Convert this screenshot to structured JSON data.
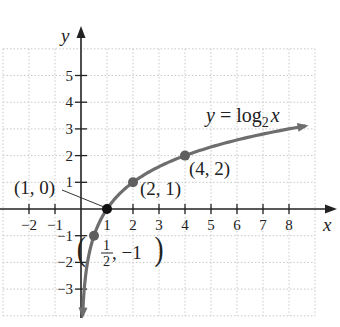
{
  "chart_data": {
    "type": "line",
    "title": "",
    "function_label": "y = log₂ x",
    "function_label_parts": {
      "lhs": "y = log",
      "base": "2",
      "var": "x"
    },
    "xlabel": "x",
    "ylabel": "y",
    "xlim": [
      -3,
      9
    ],
    "ylim": [
      -4,
      6
    ],
    "grid": true,
    "x_ticks": [
      -2,
      -1,
      1,
      2,
      3,
      4,
      5,
      6,
      7,
      8
    ],
    "x_tick_labels": [
      "−2",
      "−1",
      "1",
      "2",
      "3",
      "4",
      "5",
      "6",
      "7",
      "8"
    ],
    "y_ticks": [
      -3,
      -2,
      -1,
      1,
      2,
      3,
      4,
      5
    ],
    "y_tick_labels": [
      "−3",
      "−2",
      "−1",
      "1",
      "2",
      "3",
      "4",
      "5"
    ],
    "series": [
      {
        "name": "y = log2 x",
        "x": [
          0.0625,
          0.125,
          0.25,
          0.5,
          1,
          2,
          4,
          8,
          8.5
        ],
        "y": [
          -4,
          -3,
          -2,
          -1,
          0,
          1,
          2,
          3,
          3.09
        ],
        "color": "#6e6e6e"
      }
    ],
    "points": [
      {
        "x": 0.5,
        "y": -1,
        "label": "(1/2, −1)",
        "color": "#5f5f5f"
      },
      {
        "x": 1,
        "y": 0,
        "label": "(1, 0)",
        "color": "#111111"
      },
      {
        "x": 2,
        "y": 1,
        "label": "(2, 1)",
        "color": "#5f5f5f"
      },
      {
        "x": 4,
        "y": 2,
        "label": "(4, 2)",
        "color": "#5f5f5f"
      }
    ],
    "annotations": {
      "p10": "(1, 0)",
      "p21": "(2, 1)",
      "p42": "(4, 2)",
      "phalf_num": "1",
      "phalf_den": "2",
      "phalf_rest": ", −1"
    }
  }
}
